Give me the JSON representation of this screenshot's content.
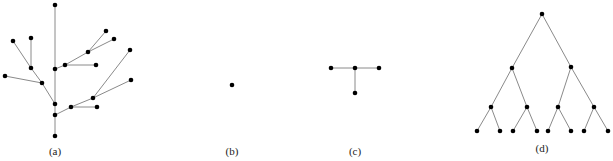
{
  "figure": {
    "panels": [
      {
        "id": "a",
        "label": "(a)",
        "description": "random tree",
        "nodes": {
          "top": [
            55,
            5
          ],
          "l1": [
            13,
            41
          ],
          "l2": [
            31,
            38
          ],
          "l3": [
            31,
            68
          ],
          "l4": [
            42,
            83
          ],
          "l5": [
            5,
            76
          ],
          "c1": [
            55,
            69
          ],
          "c2": [
            55,
            104
          ],
          "c3": [
            55,
            115
          ],
          "c4": [
            55,
            136
          ],
          "r1": [
            65,
            65
          ],
          "r2": [
            88,
            52
          ],
          "r3": [
            106,
            31
          ],
          "r4": [
            114,
            39
          ],
          "r5": [
            96,
            65
          ],
          "s1": [
            71,
            107
          ],
          "s2": [
            93,
            98
          ],
          "s3": [
            130,
            50
          ],
          "s4": [
            131,
            80
          ],
          "s5": [
            97,
            107
          ]
        },
        "edges": [
          [
            "top",
            "c1"
          ],
          [
            "c1",
            "c2"
          ],
          [
            "c2",
            "c3"
          ],
          [
            "c3",
            "c4"
          ],
          [
            "c2",
            "l4"
          ],
          [
            "l4",
            "l5"
          ],
          [
            "l4",
            "l3"
          ],
          [
            "l3",
            "l1"
          ],
          [
            "l3",
            "l2"
          ],
          [
            "c1",
            "r1"
          ],
          [
            "r1",
            "r5"
          ],
          [
            "r1",
            "r2"
          ],
          [
            "r2",
            "r3"
          ],
          [
            "r2",
            "r4"
          ],
          [
            "c3",
            "s1"
          ],
          [
            "s1",
            "s5"
          ],
          [
            "s1",
            "s2"
          ],
          [
            "s2",
            "s3"
          ],
          [
            "s2",
            "s4"
          ]
        ]
      },
      {
        "id": "b",
        "label": "(b)",
        "description": "single node",
        "nodes": {
          "n": [
            232,
            85
          ]
        },
        "edges": []
      },
      {
        "id": "c",
        "label": "(c)",
        "description": "star with three leaves",
        "nodes": {
          "center": [
            355,
            68
          ],
          "left": [
            331,
            68
          ],
          "right": [
            379,
            68
          ],
          "bottom": [
            355,
            93
          ]
        },
        "edges": [
          [
            "center",
            "left"
          ],
          [
            "center",
            "right"
          ],
          [
            "center",
            "bottom"
          ]
        ]
      },
      {
        "id": "d",
        "label": "(d)",
        "description": "complete binary tree, depth 3",
        "nodes": {
          "root": [
            542,
            14
          ],
          "a": [
            512,
            68
          ],
          "b": [
            571,
            67
          ],
          "aa": [
            491,
            107
          ],
          "ab": [
            527,
            107
          ],
          "ba": [
            558,
            107
          ],
          "bb": [
            594,
            107
          ],
          "aaa": [
            477,
            131
          ],
          "aab": [
            500,
            131
          ],
          "aba": [
            513,
            131
          ],
          "abb": [
            537,
            131
          ],
          "baa": [
            548,
            131
          ],
          "bab": [
            571,
            131
          ],
          "bba": [
            584,
            131
          ],
          "bbb": [
            608,
            131
          ]
        },
        "edges": [
          [
            "root",
            "a"
          ],
          [
            "root",
            "b"
          ],
          [
            "a",
            "aa"
          ],
          [
            "a",
            "ab"
          ],
          [
            "b",
            "ba"
          ],
          [
            "b",
            "bb"
          ],
          [
            "aa",
            "aaa"
          ],
          [
            "aa",
            "aab"
          ],
          [
            "ab",
            "aba"
          ],
          [
            "ab",
            "abb"
          ],
          [
            "ba",
            "baa"
          ],
          [
            "ba",
            "bab"
          ],
          [
            "bb",
            "bba"
          ],
          [
            "bb",
            "bbb"
          ]
        ]
      }
    ]
  }
}
